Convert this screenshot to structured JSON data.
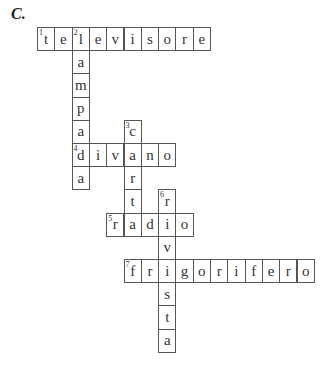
{
  "exercise_label": "C.",
  "grid": {
    "origin_x": 37,
    "origin_y": 27,
    "cell_width": 17.3,
    "cell_height": 23.2
  },
  "words": [
    {
      "number": "1",
      "word": "televisore",
      "direction": "across",
      "row": 0,
      "col": 0
    },
    {
      "number": "2",
      "word": "lampada",
      "direction": "down",
      "row": 0,
      "col": 2
    },
    {
      "number": "3",
      "word": "carta",
      "direction": "down",
      "row": 4,
      "col": 5
    },
    {
      "number": "4",
      "word": "divano",
      "direction": "across",
      "row": 5,
      "col": 2
    },
    {
      "number": "5",
      "word": "radio",
      "direction": "across",
      "row": 8,
      "col": 4
    },
    {
      "number": "6",
      "word": "rivista",
      "direction": "down",
      "row": 7,
      "col": 7
    },
    {
      "number": "7",
      "word": "frigorifero",
      "direction": "across",
      "row": 10,
      "col": 5
    }
  ]
}
